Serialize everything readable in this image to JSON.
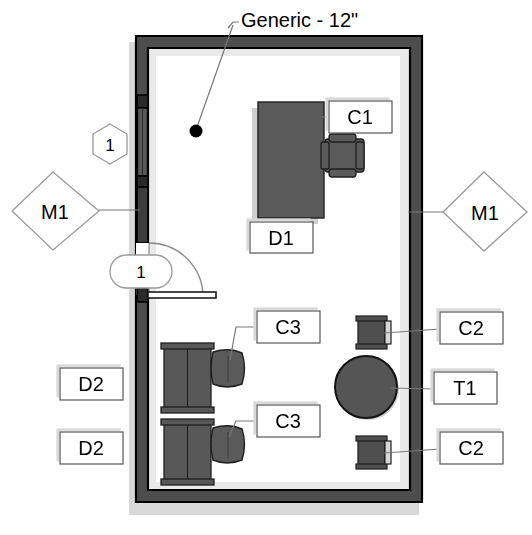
{
  "drawing": {
    "title": "Generic - 12\"",
    "type": "architectural-floor-plan",
    "colors": {
      "wall_fill": "#4d4d4d",
      "wall_outline": "#000000",
      "furniture_fill": "#5a5a5a",
      "furniture_outline": "#1a1a1a",
      "shadow": "#d6d6d6",
      "interior_band": "#e8e8e8",
      "label_fill": "#ffffff",
      "label_stroke": "#555555",
      "leader": "#777777",
      "text": "#000000",
      "background": "#ffffff"
    }
  },
  "title_callout": {
    "text": "Generic - 12\"",
    "dot_label": "wall-type-marker"
  },
  "tags": {
    "hexagon": [
      {
        "id": "hex-1",
        "text": "1"
      }
    ],
    "oval": [
      {
        "id": "oval-1",
        "text": "1"
      }
    ],
    "diamond": [
      {
        "id": "diamond-m1-left",
        "text": "M1"
      },
      {
        "id": "diamond-m1-right",
        "text": "M1"
      }
    ]
  },
  "labels": [
    {
      "id": "c1",
      "text": "C1",
      "refers_to": "chair-c1"
    },
    {
      "id": "d1",
      "text": "D1",
      "refers_to": "desk-d1"
    },
    {
      "id": "c3-upper",
      "text": "C3",
      "refers_to": "chair-c3-upper"
    },
    {
      "id": "c3-lower",
      "text": "C3",
      "refers_to": "chair-c3-lower"
    },
    {
      "id": "c2-upper",
      "text": "C2",
      "refers_to": "chair-c2-upper"
    },
    {
      "id": "c2-lower",
      "text": "C2",
      "refers_to": "chair-c2-lower"
    },
    {
      "id": "t1",
      "text": "T1",
      "refers_to": "table-t1"
    },
    {
      "id": "d2-upper",
      "text": "D2",
      "refers_to": "desk-d2-upper"
    },
    {
      "id": "d2-lower",
      "text": "D2",
      "refers_to": "desk-d2-lower"
    }
  ],
  "furniture": [
    {
      "name": "desk-d1",
      "shape": "rectangle"
    },
    {
      "name": "chair-c1",
      "shape": "chair-plan"
    },
    {
      "name": "desk-d2-upper",
      "shape": "double-desk"
    },
    {
      "name": "desk-d2-lower",
      "shape": "double-desk"
    },
    {
      "name": "chair-c3-upper",
      "shape": "rounded-blob"
    },
    {
      "name": "chair-c3-lower",
      "shape": "rounded-blob"
    },
    {
      "name": "chair-c2-upper",
      "shape": "armchair-plan"
    },
    {
      "name": "chair-c2-lower",
      "shape": "armchair-plan"
    },
    {
      "name": "table-t1",
      "shape": "circle"
    }
  ],
  "openings": [
    {
      "name": "door-swing",
      "type": "single-door-90deg"
    },
    {
      "name": "window-m1-left",
      "type": "window"
    }
  ]
}
